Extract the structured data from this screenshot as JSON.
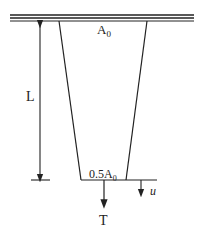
{
  "diagram": {
    "labels": {
      "top_area": "A",
      "top_area_sub": "0",
      "bottom_area": "0.5A",
      "bottom_area_sub": "0",
      "length": "L",
      "load": "T",
      "displacement": "u"
    },
    "colors": {
      "stroke": "#222222",
      "background": "#ffffff"
    }
  }
}
